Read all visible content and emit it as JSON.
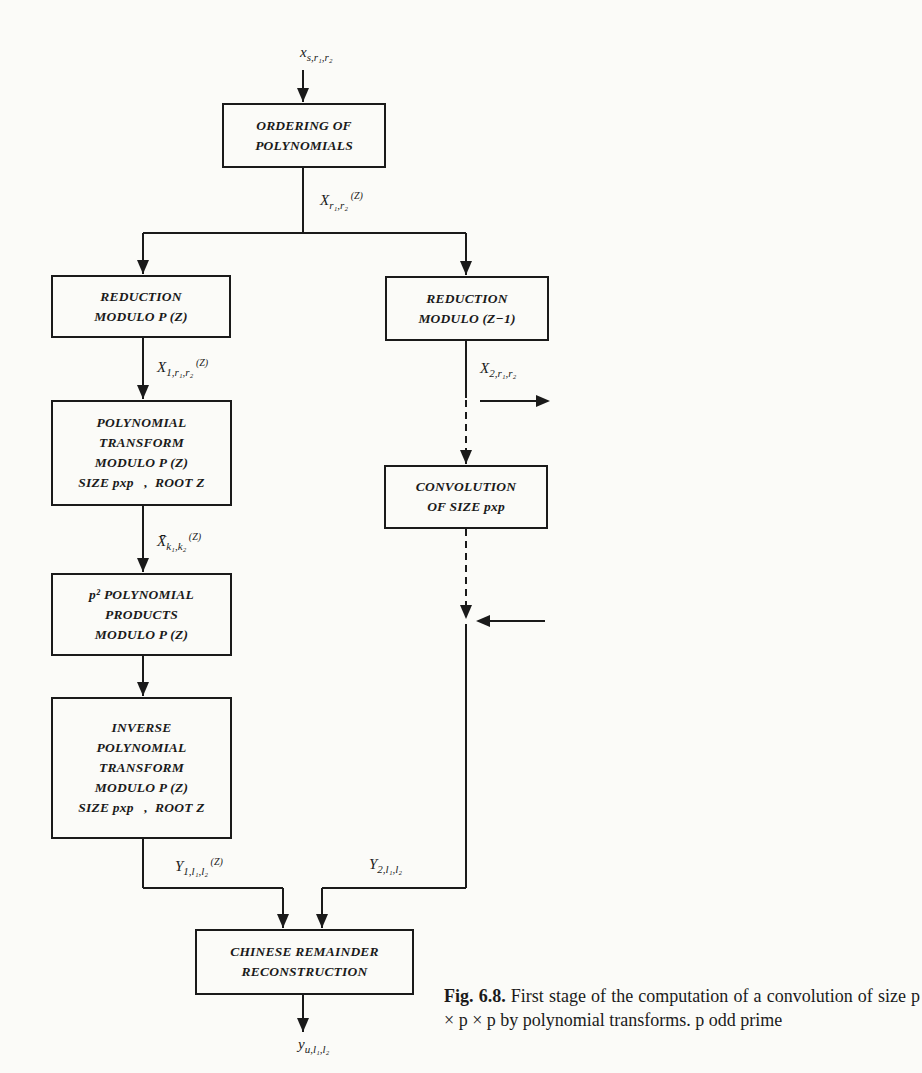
{
  "figure": {
    "boxes": {
      "ordering": [
        "ORDERING OF",
        "POLYNOMIALS"
      ],
      "reduction_left": [
        "REDUCTION",
        "MODULO P (Z)"
      ],
      "reduction_right": [
        "REDUCTION",
        "MODULO (Z−1)"
      ],
      "poly_transform": [
        "POLYNOMIAL",
        "TRANSFORM",
        "MODULO P (Z)",
        "SIZE pxp   ,  ROOT Z"
      ],
      "convolution": [
        "CONVOLUTION",
        "OF SIZE pxp"
      ],
      "products": [
        "p² POLYNOMIAL",
        "PRODUCTS",
        "MODULO P (Z)"
      ],
      "inverse": [
        "INVERSE",
        "POLYNOMIAL",
        "TRANSFORM",
        "MODULO P (Z)",
        "SIZE pxp   ,  ROOT Z"
      ],
      "chinese": [
        "CHINESE REMAINDER",
        "RECONSTRUCTION"
      ]
    },
    "labels": {
      "input": {
        "base": "x",
        "sub": "s,r₁,r₂",
        "suffix": ""
      },
      "ordered": {
        "base": "X",
        "sub": "r₁,r₂",
        "suffix": " (Z)"
      },
      "x1": {
        "base": "X",
        "sub": "1,r₁,r₂",
        "suffix": " (Z)"
      },
      "x2": {
        "base": "X",
        "sub": "2,r₁,r₂",
        "suffix": ""
      },
      "xbar": {
        "base": "X̄",
        "sub": "k₁,k₂",
        "suffix": " (Z)"
      },
      "y1": {
        "base": "Y",
        "sub": "1,l₁,l₂",
        "suffix": " (Z)"
      },
      "y2": {
        "base": "Y",
        "sub": "2,l₁,l₂",
        "suffix": ""
      },
      "output": {
        "base": "y",
        "sub": "u,l₁,l₂",
        "suffix": ""
      }
    },
    "caption": {
      "number": "Fig. 6.8.",
      "text": " First stage of the computation of a convolution of size p × p × p by polynomial transforms. p odd prime"
    }
  },
  "colors": {
    "ink": "#1a1a1a",
    "paper": "#fbfbf8"
  }
}
